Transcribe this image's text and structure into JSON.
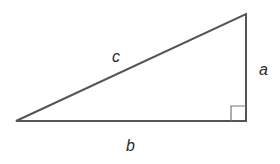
{
  "diagram": {
    "type": "right-triangle",
    "labels": {
      "hypotenuse": "c",
      "vertical_leg": "a",
      "horizontal_leg": "b"
    },
    "right_angle_marker": true,
    "colors": {
      "stroke": "#555555",
      "text": "#2a2a2a",
      "background": "#ffffff"
    }
  }
}
